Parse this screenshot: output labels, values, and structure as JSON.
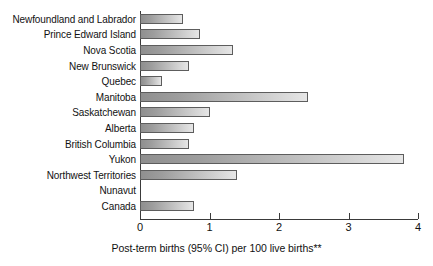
{
  "chart_data": {
    "type": "bar",
    "orientation": "horizontal",
    "title": "",
    "subtitle": "",
    "xlabel": "Post-term births (95% CI) per 100 live births**",
    "ylabel": "",
    "xlim": [
      0,
      4
    ],
    "xticks": [
      0,
      1,
      2,
      3,
      4
    ],
    "xtick_labels": [
      "0",
      "1",
      "2",
      "3",
      "4"
    ],
    "grid": false,
    "legend": null,
    "categories": [
      "Newfoundland and Labrador",
      "Prince Edward Island",
      "Nova Scotia",
      "New Brunswick",
      "Quebec",
      "Manitoba",
      "Saskatchewan",
      "Alberta",
      "British Columbia",
      "Yukon",
      "Northwest Territories",
      "Nunavut",
      "Canada"
    ],
    "values": [
      0.62,
      0.87,
      1.34,
      0.7,
      0.31,
      2.42,
      1.0,
      0.78,
      0.7,
      3.8,
      1.4,
      0.0,
      0.78
    ],
    "bar_color_start": "#8f8f8f",
    "bar_color_end": "#e6e6e6",
    "bar_border_color": "#5d5d5d",
    "axis_color": "#3a3a3a",
    "background": "#ffffff"
  },
  "axis": {
    "caption": "Post-term births (95% CI) per 100 live births**",
    "tick_labels": [
      "0",
      "1",
      "2",
      "3",
      "4"
    ]
  },
  "rows": [
    {
      "label": "Newfoundland and Labrador",
      "value": 0.62
    },
    {
      "label": "Prince Edward Island",
      "value": 0.87
    },
    {
      "label": "Nova Scotia",
      "value": 1.34
    },
    {
      "label": "New Brunswick",
      "value": 0.7
    },
    {
      "label": "Quebec",
      "value": 0.31
    },
    {
      "label": "Manitoba",
      "value": 2.42
    },
    {
      "label": "Saskatchewan",
      "value": 1.0
    },
    {
      "label": "Alberta",
      "value": 0.78
    },
    {
      "label": "British Columbia",
      "value": 0.7
    },
    {
      "label": "Yukon",
      "value": 3.8
    },
    {
      "label": "Northwest Territories",
      "value": 1.4
    },
    {
      "label": "Nunavut",
      "value": 0.0
    },
    {
      "label": "Canada",
      "value": 0.78
    }
  ]
}
